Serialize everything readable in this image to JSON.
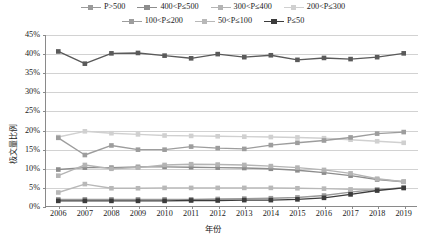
{
  "chart_data": {
    "type": "line",
    "title": "",
    "xlabel": "年份",
    "ylabel": "极文量比例",
    "ylim": [
      0,
      45
    ],
    "ytick_labels": [
      "45%",
      "40%",
      "35%",
      "30%",
      "25%",
      "20%",
      "15%",
      "10%",
      "5%",
      "0%"
    ],
    "ytick_values": [
      45,
      40,
      35,
      30,
      25,
      20,
      15,
      10,
      5,
      0
    ],
    "grid": true,
    "legend_position": "top",
    "x": [
      2006,
      2007,
      2008,
      2009,
      2010,
      2011,
      2012,
      2013,
      2014,
      2015,
      2016,
      2017,
      2018,
      2019
    ],
    "categories": [
      "2006",
      "2007",
      "2008",
      "2009",
      "2010",
      "2011",
      "2012",
      "2013",
      "2014",
      "2015",
      "2016",
      "2017",
      "2018",
      "2019"
    ],
    "series": [
      {
        "name": "P>500",
        "color": "#9a9a9a",
        "values": [
          2.0,
          2.0,
          2.0,
          2.0,
          2.0,
          2.0,
          2.1,
          2.2,
          2.3,
          2.5,
          3.0,
          3.9,
          4.6,
          5.0
        ]
      },
      {
        "name": "400<P≤500",
        "color": "#8d8d8d",
        "values": [
          9.8,
          10.3,
          10.3,
          10.5,
          10.5,
          10.4,
          10.3,
          10.2,
          10.0,
          9.6,
          9.0,
          8.2,
          7.2,
          6.6
        ]
      },
      {
        "name": "300<P≤400",
        "color": "#b4b4b4",
        "values": [
          8.2,
          11.0,
          10.0,
          10.3,
          11.0,
          11.2,
          11.1,
          11.0,
          10.7,
          10.3,
          9.7,
          8.8,
          7.4,
          6.6
        ]
      },
      {
        "name": "200<P≤300",
        "color": "#d0d0d0",
        "values": [
          18.3,
          19.8,
          19.3,
          19.0,
          18.7,
          18.6,
          18.5,
          18.4,
          18.3,
          18.2,
          18.0,
          17.6,
          17.2,
          16.8
        ]
      },
      {
        "name": "100<P≤200",
        "color": "#9d9d9d",
        "values": [
          18.1,
          13.6,
          16.1,
          15.0,
          15.0,
          15.8,
          15.4,
          15.2,
          16.2,
          16.8,
          17.4,
          18.2,
          19.2,
          19.6
        ]
      },
      {
        "name": "50<P≤100",
        "color": "#b8b8b8",
        "values": [
          3.8,
          6.0,
          4.9,
          4.9,
          5.0,
          5.0,
          5.0,
          5.0,
          5.0,
          4.9,
          4.8,
          4.6,
          4.5,
          5.0
        ]
      },
      {
        "name": "P≤50",
        "color": "#5a5a5a",
        "values": [
          40.7,
          37.5,
          40.2,
          40.3,
          39.6,
          38.9,
          40.0,
          39.2,
          39.7,
          38.5,
          39.0,
          38.7,
          39.2,
          40.2
        ]
      }
    ],
    "overlay_series": [
      {
        "name": "P≤50-low",
        "color": "#3c3c3c",
        "values": [
          1.6,
          1.6,
          1.6,
          1.6,
          1.6,
          1.7,
          1.7,
          1.8,
          1.8,
          2.0,
          2.4,
          3.3,
          4.3,
          5.0
        ]
      }
    ]
  },
  "legend": {
    "rows": [
      [
        {
          "label": "P>500",
          "color": "#9a9a9a"
        },
        {
          "label": "400<P≤500",
          "color": "#8d8d8d"
        },
        {
          "label": "300<P≤400",
          "color": "#b4b4b4"
        },
        {
          "label": "200<P≤300",
          "color": "#d0d0d0"
        }
      ],
      [
        {
          "label": "100<P≤200",
          "color": "#9d9d9d"
        },
        {
          "label": "50<P≤100",
          "color": "#b8b8b8"
        },
        {
          "label": "P≤50",
          "color": "#3c3c3c"
        }
      ]
    ]
  }
}
